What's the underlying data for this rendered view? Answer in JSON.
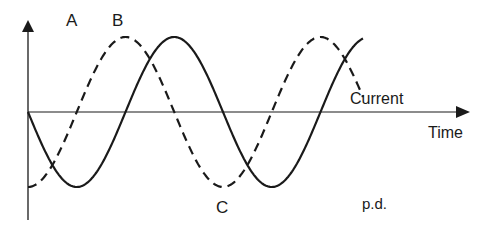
{
  "diagram": {
    "axes": {
      "x_label": "Time",
      "y_label": ""
    },
    "curves": [
      {
        "name": "p.d.",
        "label": "p.d.",
        "style": "dashed",
        "phase_lead_fraction": 0.25,
        "cycles_shown": 1.72
      },
      {
        "name": "Current",
        "label": "Current",
        "style": "solid",
        "phase_lead_fraction": 0,
        "cycles_shown": 1.72
      }
    ],
    "points": [
      {
        "label": "A",
        "description": "peak of p.d."
      },
      {
        "label": "B",
        "description": "peak of current"
      },
      {
        "label": "C",
        "description": "trough of current"
      }
    ],
    "stroke_color": "#1a1a1a"
  }
}
